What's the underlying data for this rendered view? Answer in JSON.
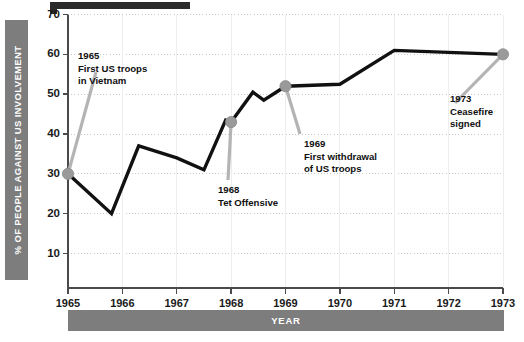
{
  "chart_data": {
    "type": "line",
    "title": "",
    "xlabel": "YEAR",
    "ylabel": "% OF PEOPLE AGAINST US INVOLVEMENT",
    "xlim": [
      1965,
      1973
    ],
    "ylim": [
      0,
      70
    ],
    "ytick_labels": [
      "70",
      "60",
      "50",
      "40",
      "30",
      "20",
      "10"
    ],
    "ytick_values": [
      70,
      60,
      50,
      40,
      30,
      20,
      10
    ],
    "xtick_labels": [
      "1965",
      "1966",
      "1967",
      "1968",
      "1969",
      "1970",
      "1971",
      "1972",
      "1973"
    ],
    "xtick_values": [
      1965,
      1966,
      1967,
      1968,
      1969,
      1970,
      1971,
      1972,
      1973
    ],
    "grid": "horizontal-dotted-and-vertical-faint",
    "legend": "none",
    "series": [
      {
        "name": "% of people against US involvement",
        "color": "#111111",
        "marker_color": "#9a9a9a",
        "points": [
          {
            "x": 1965.0,
            "y": 30,
            "marker": true
          },
          {
            "x": 1965.8,
            "y": 20,
            "marker": false
          },
          {
            "x": 1966.3,
            "y": 37,
            "marker": false
          },
          {
            "x": 1967.0,
            "y": 34,
            "marker": false
          },
          {
            "x": 1967.5,
            "y": 31,
            "marker": false
          },
          {
            "x": 1967.9,
            "y": 43.5,
            "marker": false
          },
          {
            "x": 1968.0,
            "y": 43,
            "marker": true
          },
          {
            "x": 1968.4,
            "y": 50.5,
            "marker": false
          },
          {
            "x": 1968.6,
            "y": 48.5,
            "marker": false
          },
          {
            "x": 1969.0,
            "y": 52,
            "marker": true
          },
          {
            "x": 1970.0,
            "y": 52.5,
            "marker": false
          },
          {
            "x": 1971.0,
            "y": 61,
            "marker": false
          },
          {
            "x": 1973.0,
            "y": 60,
            "marker": true
          }
        ]
      }
    ],
    "annotations": [
      {
        "id": "anno-1965",
        "year_label": "1965",
        "lines": [
          "First US troops",
          "in Vietnam"
        ],
        "target_x": 1965.0,
        "target_y": 30
      },
      {
        "id": "anno-1968",
        "year_label": "1968",
        "lines": [
          "Tet Offensive"
        ],
        "target_x": 1968.0,
        "target_y": 43
      },
      {
        "id": "anno-1969",
        "year_label": "1969",
        "lines": [
          "First withdrawal",
          "of US troops"
        ],
        "target_x": 1969.0,
        "target_y": 52
      },
      {
        "id": "anno-1973",
        "year_label": "1973",
        "lines": [
          "Ceasefire",
          "signed"
        ],
        "target_x": 1973.0,
        "target_y": 60
      }
    ]
  },
  "axis": {
    "y_title": "% OF PEOPLE AGAINST US INVOLVEMENT",
    "x_title": "YEAR",
    "y_ticks": [
      "70",
      "60",
      "50",
      "40",
      "30",
      "20",
      "10"
    ],
    "x_ticks": [
      "1965",
      "1966",
      "1967",
      "1968",
      "1969",
      "1970",
      "1971",
      "1972",
      "1973"
    ]
  },
  "annotations": {
    "a1965": {
      "year": "1965",
      "line1": "First US troops",
      "line2": "in Vietnam"
    },
    "a1968": {
      "year": "1968",
      "line1": "Tet Offensive",
      "line2": ""
    },
    "a1969": {
      "year": "1969",
      "line1": "First withdrawal",
      "line2": "of US troops"
    },
    "a1973": {
      "year": "1973",
      "line1": "Ceasefire",
      "line2": "signed"
    }
  },
  "colors": {
    "line": "#111111",
    "marker": "#9a9a9a",
    "leader": "#b4b4b4",
    "bar": "#7d7d7d",
    "grid": "#c8c8c8",
    "axis": "#4a4a4a"
  }
}
